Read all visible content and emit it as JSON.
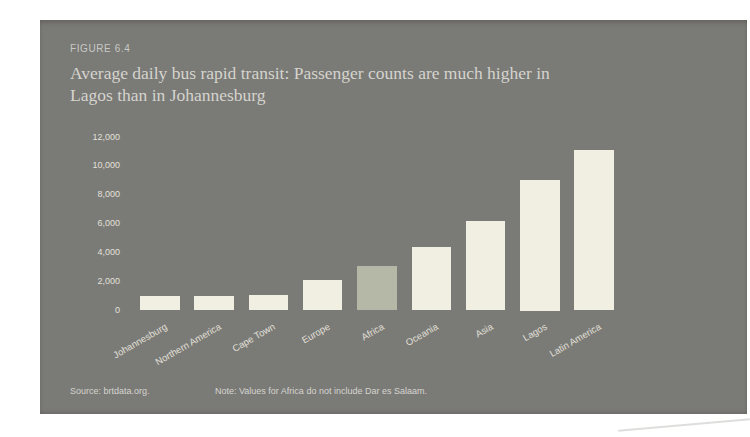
{
  "figure": {
    "label": "FIGURE 6.4",
    "title_line1": "Average daily bus rapid transit: Passenger counts are much higher in",
    "title_line2": "Lagos than in Johannesburg",
    "source": "Source: brtdata.org.",
    "note": "Note: Values for Africa do not include Dar es Salaam."
  },
  "colors": {
    "panel_bg": "#7a7a77",
    "bar": "#f0efe2",
    "bar_highlight": "#b5b8a6",
    "text_light": "#e2e0d7",
    "title_text": "#d5d4cd"
  },
  "chart_data": {
    "type": "bar",
    "title": "Average daily bus rapid transit: Passenger counts are much higher in Lagos than in Johannesburg",
    "categories": [
      "Johannesburg",
      "Northern America",
      "Cape Town",
      "Europe",
      "Africa",
      "Oceania",
      "Asia",
      "Lagos",
      "Latin America"
    ],
    "values": [
      1000,
      1000,
      1100,
      2100,
      3100,
      4400,
      6200,
      9000,
      11100
    ],
    "highlight_category": "Africa",
    "xlabel": "",
    "ylabel": "",
    "ylim": [
      0,
      12000
    ],
    "yticks": [
      0,
      2000,
      4000,
      6000,
      8000,
      10000,
      12000
    ],
    "ytick_labels": [
      "0",
      "2,000",
      "4,000",
      "6,000",
      "8,000",
      "10,000",
      "12,000"
    ],
    "grid": false,
    "legend": false
  }
}
